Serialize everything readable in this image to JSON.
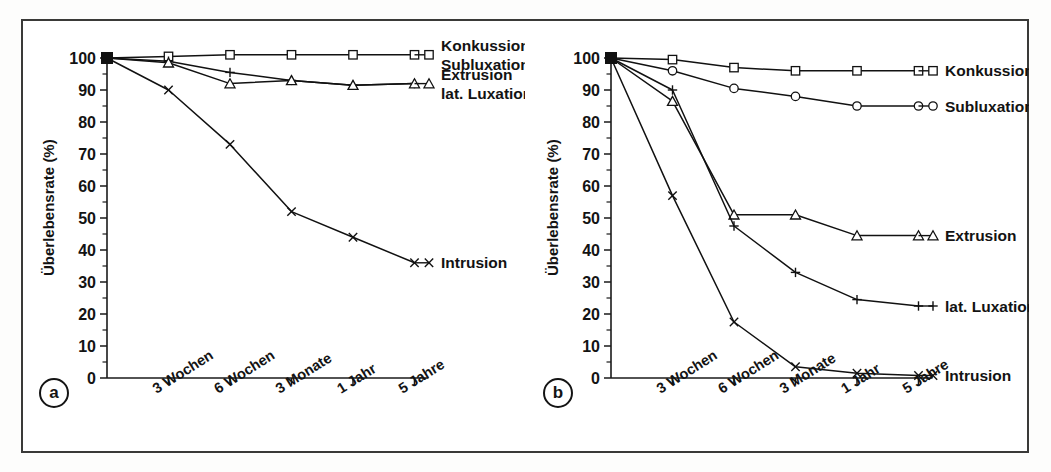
{
  "figure": {
    "panels": [
      {
        "tag": "a",
        "y_axis_title": "Überlebensrate (%)",
        "y_ticks": [
          "0",
          "10",
          "20",
          "30",
          "40",
          "50",
          "60",
          "70",
          "80",
          "90",
          "100"
        ],
        "x_categories": [
          "3 Wochen",
          "6 Wochen",
          "3 Monate",
          "1 Jahr",
          "5 Jahre"
        ],
        "series_labels": [
          {
            "marker": "square",
            "lines": [
              "Konkussion",
              "Subluxation"
            ]
          },
          {
            "marker": "triangle",
            "lines": [
              "Extrusion",
              "lat. Luxation"
            ]
          },
          {
            "marker": "cross",
            "lines": [
              "Intrusion"
            ]
          }
        ]
      },
      {
        "tag": "b",
        "y_axis_title": "Überlebensrate (%)",
        "y_ticks": [
          "0",
          "10",
          "20",
          "30",
          "40",
          "50",
          "60",
          "70",
          "80",
          "90",
          "100"
        ],
        "x_categories": [
          "3 Wochen",
          "6 Wochen",
          "3 Monate",
          "1 Jahr",
          "5 Jahre"
        ],
        "series_labels": [
          {
            "marker": "square",
            "lines": [
              "Konkussion"
            ]
          },
          {
            "marker": "circle",
            "lines": [
              "Subluxation"
            ]
          },
          {
            "marker": "triangle",
            "lines": [
              "Extrusion"
            ]
          },
          {
            "marker": "plus",
            "lines": [
              "lat. Luxation"
            ]
          },
          {
            "marker": "cross",
            "lines": [
              "Intrusion"
            ]
          }
        ]
      }
    ]
  },
  "chart_data": [
    {
      "type": "line",
      "title": "a",
      "xlabel": "",
      "ylabel": "Überlebensrate (%)",
      "ylim": [
        0,
        100
      ],
      "yticks": [
        0,
        10,
        20,
        30,
        40,
        50,
        60,
        70,
        80,
        90,
        100
      ],
      "minor_tick_interval": 5,
      "grid": false,
      "legend_position": "right-inline",
      "categories": [
        "0",
        "3 Wochen",
        "6 Wochen",
        "3 Monate",
        "1 Jahr",
        "5 Jahre"
      ],
      "series": [
        {
          "name": "Konkussion / Subluxation",
          "marker": "square",
          "values": [
            100,
            100.5,
            101,
            101,
            101,
            101
          ]
        },
        {
          "name": "lat. Luxation",
          "marker": "plus",
          "values": [
            100,
            99,
            95.5,
            93,
            91.5,
            92
          ]
        },
        {
          "name": "Extrusion",
          "marker": "triangle",
          "values": [
            100,
            98.5,
            92,
            93,
            91.5,
            92
          ]
        },
        {
          "name": "Intrusion",
          "marker": "cross",
          "values": [
            100,
            90,
            73,
            52,
            44,
            36
          ]
        }
      ]
    },
    {
      "type": "line",
      "title": "b",
      "xlabel": "",
      "ylabel": "Überlebensrate (%)",
      "ylim": [
        0,
        100
      ],
      "yticks": [
        0,
        10,
        20,
        30,
        40,
        50,
        60,
        70,
        80,
        90,
        100
      ],
      "minor_tick_interval": 5,
      "grid": false,
      "legend_position": "right-inline",
      "categories": [
        "0",
        "3 Wochen",
        "6 Wochen",
        "3 Monate",
        "1 Jahr",
        "5 Jahre"
      ],
      "series": [
        {
          "name": "Konkussion",
          "marker": "square",
          "values": [
            100,
            99.5,
            97,
            96,
            96,
            96
          ]
        },
        {
          "name": "Subluxation",
          "marker": "circle",
          "values": [
            100,
            96,
            90.5,
            88,
            85,
            85
          ]
        },
        {
          "name": "Extrusion",
          "marker": "triangle",
          "values": [
            100,
            86.5,
            51,
            51,
            44.5,
            44.5
          ]
        },
        {
          "name": "lat. Luxation",
          "marker": "plus",
          "values": [
            100,
            90,
            47.5,
            33,
            24.5,
            22.5
          ]
        },
        {
          "name": "Intrusion",
          "marker": "cross",
          "values": [
            100,
            57,
            17.5,
            3.5,
            1.5,
            0.8
          ]
        }
      ]
    }
  ]
}
